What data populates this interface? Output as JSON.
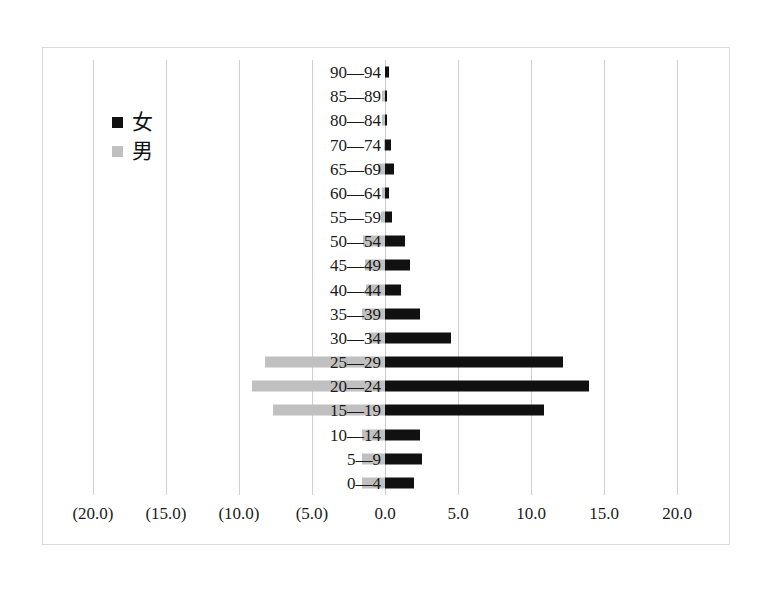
{
  "chart_data": {
    "type": "bar",
    "title": "",
    "subtitle": "",
    "xlabel": "",
    "ylabel": "",
    "orientation": "horizontal",
    "layout": "population-pyramid",
    "grid": true,
    "legend_position": "upper-left",
    "xlim": [
      -20.0,
      20.0
    ],
    "xticks": [
      -20.0,
      -15.0,
      -10.0,
      -5.0,
      0.0,
      5.0,
      10.0,
      15.0,
      20.0
    ],
    "xtick_labels": [
      "(20.0)",
      "(15.0)",
      "(10.0)",
      "(5.0)",
      "0.0",
      "5.0",
      "10.0",
      "15.0",
      "20.0"
    ],
    "negative_labels_in_parentheses": true,
    "categories": [
      "90—94",
      "85—89",
      "80—84",
      "70—74",
      "65—69",
      "60—64",
      "55—59",
      "50—54",
      "45—49",
      "40—44",
      "35—39",
      "30—34",
      "25—29",
      "20—24",
      "15—19",
      "10—14",
      "5—9",
      "0—4"
    ],
    "series": [
      {
        "name": "女",
        "color": "#111111",
        "side": "right",
        "values": [
          0.3,
          0.1,
          0.05,
          0.4,
          0.6,
          0.3,
          0.5,
          1.4,
          1.7,
          1.1,
          2.4,
          4.5,
          12.2,
          14.0,
          10.9,
          2.4,
          2.5,
          2.0
        ]
      },
      {
        "name": "男",
        "color": "#c0c0c0",
        "side": "left",
        "values": [
          0.0,
          0.2,
          0.2,
          0.1,
          0.5,
          0.2,
          0.3,
          1.5,
          1.4,
          1.3,
          1.6,
          1.1,
          8.2,
          9.1,
          7.7,
          1.6,
          1.6,
          1.6
        ]
      }
    ]
  },
  "legend": {
    "items": [
      {
        "label": "女",
        "color": "#111111"
      },
      {
        "label": "男",
        "color": "#c0c0c0"
      }
    ]
  },
  "colors": {
    "female": "#111111",
    "male": "#c0c0c0",
    "gridline": "#d0d0d0",
    "frame": "#d9d9d9",
    "background": "#ffffff",
    "text": "#1a1a1a"
  }
}
